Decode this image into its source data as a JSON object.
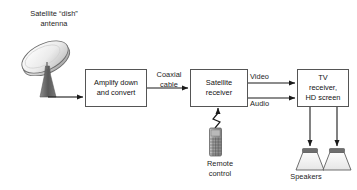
{
  "diagram": {
    "background_color": "#ffffff",
    "line_color": "#222222",
    "box_border_color": "#555555",
    "dish_color": "#d9d9d9",
    "stand_color": "#777777",
    "speaker_band_color": "#6e6e6e",
    "remote_color": "#9a9a9a",
    "nodes": {
      "dish_label": "Satellite “dish”\nantenna",
      "amplifier_box": "Amplify down\nand convert",
      "coax_label": "Coaxial\ncable",
      "receiver_box": "Satellite\nreceiver",
      "video_label": "Video",
      "audio_label": "Audio",
      "tv_box": "TV\nreceiver,\nHD screen",
      "remote_label": "Remote\ncontrol",
      "speakers_label": "Speakers"
    }
  }
}
